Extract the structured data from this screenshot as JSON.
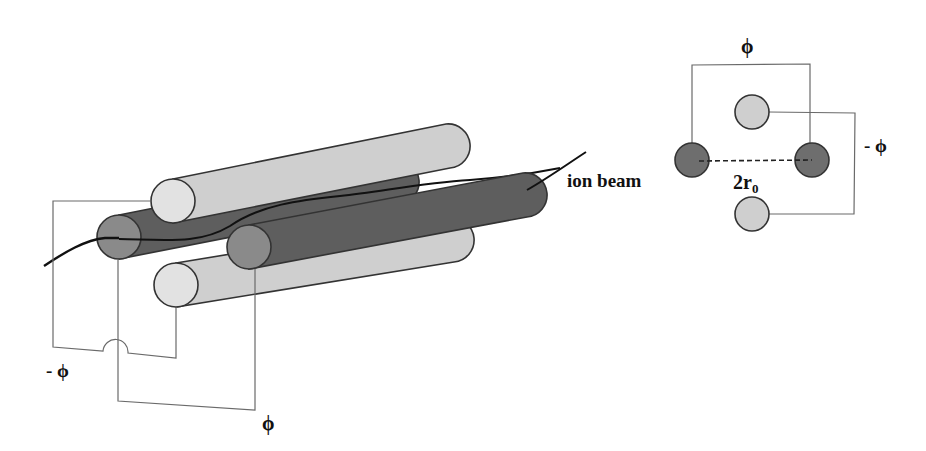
{
  "diagram": {
    "type": "quadrupole-ion-guide",
    "labels": {
      "ion_beam": "ion beam",
      "phi_bottom": "ϕ",
      "minus_phi_left": "- ϕ",
      "phi_top_right": "ϕ",
      "minus_phi_right": "- ϕ",
      "two_r0_main": "2r",
      "two_r0_sub": "0"
    },
    "colors": {
      "light_rod": "#cfcfcf",
      "light_cap": "#e2e2e2",
      "dark_rod": "#5e5e5e",
      "dark_cap": "#8a8a8a",
      "beam": "#111111",
      "wire": "#6a6a6a",
      "outline": "#333333"
    },
    "rods_3d": [
      {
        "name": "top-light-rod",
        "polarity": "-phi"
      },
      {
        "name": "left-dark-rod",
        "polarity": "phi"
      },
      {
        "name": "right-dark-rod",
        "polarity": "phi"
      },
      {
        "name": "bottom-light-rod",
        "polarity": "-phi"
      }
    ],
    "cross_section": [
      {
        "name": "top-light-electrode",
        "polarity": "-phi"
      },
      {
        "name": "left-dark-electrode",
        "polarity": "phi"
      },
      {
        "name": "right-dark-electrode",
        "polarity": "phi"
      },
      {
        "name": "bottom-light-electrode",
        "polarity": "-phi"
      }
    ]
  }
}
